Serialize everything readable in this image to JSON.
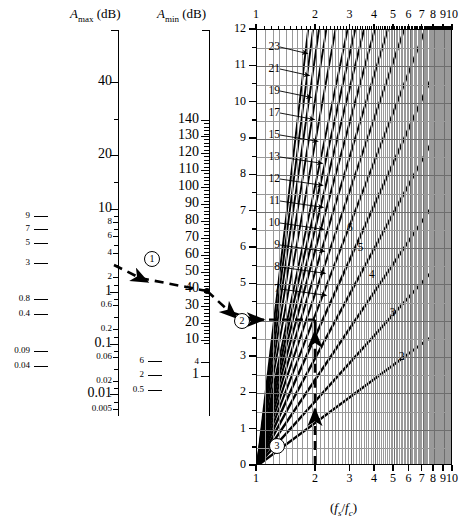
{
  "figure": {
    "type": "nomograph"
  },
  "scales": {
    "amax": {
      "title_main": "A",
      "title_sub": "max",
      "title_unit": "(dB)",
      "labels": [
        "40",
        "20",
        "10",
        "8",
        "6",
        "4",
        "2",
        "1",
        "0.6",
        "0.2",
        "0.1",
        "0.06",
        "0.02",
        "0.01",
        "0.005"
      ],
      "aux_labels": [
        "9",
        "7",
        "5",
        "3",
        "0.8",
        "0.4",
        "0.09",
        "0.04"
      ]
    },
    "amin": {
      "title_main": "A",
      "title_sub": "min",
      "title_unit": "(dB)",
      "labels": [
        "140",
        "130",
        "120",
        "110",
        "100",
        "90",
        "80",
        "70",
        "60",
        "50",
        "40",
        "30",
        "20",
        "10",
        "4",
        "1"
      ],
      "aux_labels": [
        "6",
        "2",
        "0.5"
      ]
    }
  },
  "chart_data": {
    "type": "line",
    "title": "",
    "xlabel": "(fs/fc)",
    "ylabel": "",
    "xscale": "log",
    "xlim": [
      1,
      10
    ],
    "ylim": [
      0,
      12
    ],
    "xticks": [
      "1",
      "2",
      "3",
      "4",
      "5",
      "6",
      "7",
      "8",
      "9",
      "10"
    ],
    "yticks": [
      "0",
      "1",
      "2",
      "3",
      "4",
      "5",
      "6",
      "7",
      "8",
      "9",
      "10",
      "11",
      "12"
    ],
    "grid": true,
    "legend": "none",
    "series_note": "Each line is the filter order n; y = A-scale reading, x = fs/fc",
    "orders_labeled_left": [
      "23",
      "21",
      "19",
      "17",
      "15",
      "13",
      "12",
      "11",
      "10",
      "9",
      "8",
      "7"
    ],
    "orders_labeled_inline": [
      "6",
      "5",
      "4",
      "3",
      "2"
    ]
  },
  "annotations": {
    "step1": "1",
    "step2": "2",
    "step3": "3",
    "amax_point": "3",
    "amin_point": "40",
    "order_point": "4",
    "freq_point": "2"
  },
  "xaxis_title": {
    "open": "(",
    "f1": "f",
    "s1": "s",
    "slash": "/",
    "f2": "f",
    "s2": "c",
    "close": ")"
  }
}
